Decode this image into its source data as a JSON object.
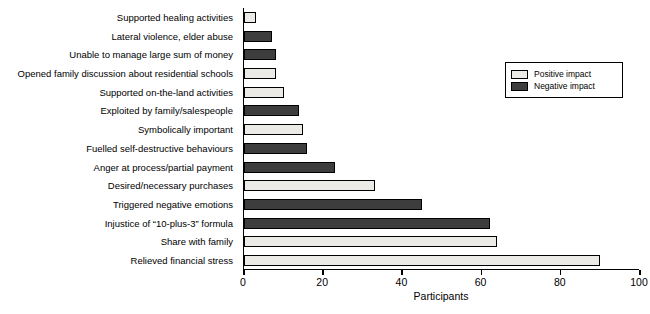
{
  "chart_data": {
    "type": "bar",
    "orientation": "horizontal",
    "title": "",
    "xlabel": "Participants",
    "ylabel": "",
    "xlim": [
      0,
      100
    ],
    "xticks": [
      0,
      20,
      40,
      60,
      80,
      100
    ],
    "grid": false,
    "legend_position": "top-right",
    "legend": [
      {
        "name": "Positive impact",
        "color": "#eceae6"
      },
      {
        "name": "Negative impact",
        "color": "#3d3d3d"
      }
    ],
    "categories": [
      "Supported healing activities",
      "Lateral violence, elder abuse",
      "Unable to manage large sum of money",
      "Opened family discussion about residential schools",
      "Supported on-the-land activities",
      "Exploited by family/salespeople",
      "Symbolically important",
      "Fuelled self-destructive behaviours",
      "Anger at process/partial payment",
      "Desired/necessary purchases",
      "Triggered negative emotions",
      "Injustice of “10-plus-3” formula",
      "Share with family",
      "Relieved financial stress"
    ],
    "values": [
      3,
      7,
      8,
      8,
      10,
      14,
      15,
      16,
      23,
      33,
      45,
      62,
      64,
      90
    ],
    "impacts": [
      "positive",
      "negative",
      "negative",
      "positive",
      "positive",
      "negative",
      "positive",
      "negative",
      "negative",
      "positive",
      "negative",
      "negative",
      "positive",
      "positive"
    ]
  }
}
